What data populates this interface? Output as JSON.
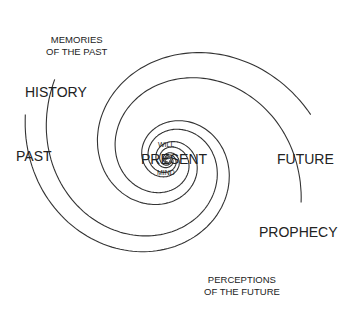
{
  "diagram": {
    "type": "spiral",
    "center_label": "PRESENT",
    "center_top_label": "WILL",
    "center_bottom_label": "MIND",
    "labels": {
      "memories": [
        "MEMORIES",
        "OF THE PAST"
      ],
      "history": "HISTORY",
      "past": "PAST",
      "future": "FUTURE",
      "prophecy": "PROPHECY",
      "perceptions": [
        "PERCEPTIONS",
        "OF THE FUTURE"
      ]
    },
    "colors": {
      "line": "#333333",
      "text": "#222222",
      "background": "#ffffff"
    }
  }
}
